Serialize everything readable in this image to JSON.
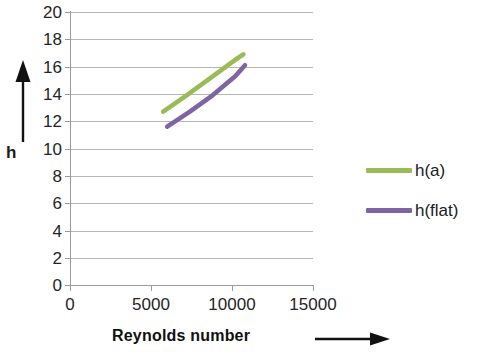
{
  "chart_data": {
    "type": "line",
    "title": "",
    "xlabel": "Reynolds number",
    "ylabel": "h",
    "xlim": [
      0,
      15000
    ],
    "ylim": [
      0,
      20
    ],
    "xticks": [
      0,
      5000,
      10000,
      15000
    ],
    "xtick_labels": [
      "0",
      "5000",
      "10000",
      "15000"
    ],
    "yticks": [
      0,
      2,
      4,
      6,
      8,
      10,
      12,
      14,
      16,
      18,
      20
    ],
    "ytick_labels": [
      "0",
      "2",
      "4",
      "6",
      "8",
      "10",
      "12",
      "14",
      "16",
      "18",
      "20"
    ],
    "grid": "horizontal",
    "legend_position": "right",
    "series": [
      {
        "name": "h(a)",
        "color": "#9BBB59",
        "x": [
          5750,
          7200,
          8700,
          10200,
          10700
        ],
        "values": [
          12.7,
          13.9,
          15.2,
          16.5,
          16.9
        ]
      },
      {
        "name": "h(flat)",
        "color": "#8064A2",
        "x": [
          6000,
          7400,
          8800,
          10200,
          10800
        ],
        "values": [
          11.6,
          12.7,
          13.9,
          15.3,
          16.1
        ]
      }
    ]
  },
  "axes": {
    "y_title": "h",
    "x_title": "Reynolds number"
  },
  "legend": {
    "items": [
      {
        "label": "h(a)",
        "color": "#9BBB59"
      },
      {
        "label": "h(flat)",
        "color": "#8064A2"
      }
    ]
  },
  "annotations": {
    "y_arrow": "up-arrow",
    "x_arrow": "right-arrow"
  }
}
